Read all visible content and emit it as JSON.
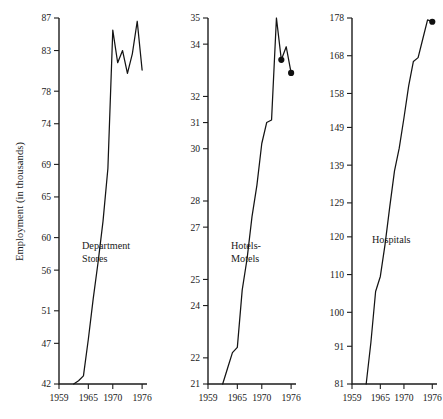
{
  "figure": {
    "background_color": "#ffffff",
    "line_color": "#141414",
    "axis_color": "#1d1d1d",
    "y_axis_title": "Employment (in thousands)"
  },
  "chart_data": [
    {
      "type": "line",
      "title": "Department Stores",
      "series_label": "Department Stores",
      "xlabel": "",
      "ylabel": "Employment (in thousands)",
      "grid": false,
      "legend": "none",
      "xlim": [
        1959,
        1977
      ],
      "ylim": [
        42,
        87
      ],
      "xticks": [
        1959,
        1965,
        1970,
        1976
      ],
      "xticklabels": [
        "1959",
        "1965",
        "1970",
        "1976"
      ],
      "yticks": [
        42,
        47,
        51,
        56,
        60,
        65,
        69,
        74,
        78,
        83,
        87
      ],
      "yticklabels": [
        "42",
        "47",
        "51",
        "56",
        "60",
        "65",
        "69",
        "74",
        "78",
        "83",
        "87"
      ],
      "x": [
        1962,
        1963,
        1964,
        1965,
        1966,
        1967,
        1968,
        1969,
        1970,
        1971,
        1972,
        1973,
        1974,
        1975,
        1976
      ],
      "values": [
        42.0,
        42.4,
        43.0,
        47.5,
        52.5,
        57.0,
        62.0,
        68.5,
        85.5,
        81.5,
        83.0,
        80.2,
        82.6,
        86.6,
        80.6
      ],
      "endpoint_markers": 0
    },
    {
      "type": "line",
      "title": "Hotels-Motels",
      "series_label": "Hotels-Motels",
      "xlabel": "",
      "ylabel": "",
      "grid": false,
      "legend": "none",
      "xlim": [
        1959,
        1977
      ],
      "ylim": [
        21,
        35
      ],
      "xticks": [
        1959,
        1965,
        1970,
        1976
      ],
      "xticklabels": [
        "1959",
        "1965",
        "1970",
        "1976"
      ],
      "yticks": [
        21,
        22,
        24,
        25,
        27,
        28,
        30,
        31,
        32,
        34,
        35
      ],
      "yticklabels": [
        "21",
        "22",
        "24",
        "25",
        "27",
        "28",
        "30",
        "31",
        "32",
        "34",
        "35"
      ],
      "x": [
        1962,
        1963,
        1964,
        1965,
        1966,
        1967,
        1968,
        1969,
        1970,
        1971,
        1972,
        1973,
        1974,
        1975,
        1976
      ],
      "values": [
        21.0,
        21.6,
        22.2,
        22.4,
        24.6,
        25.8,
        27.4,
        28.6,
        30.2,
        31.0,
        31.1,
        35.0,
        33.4,
        33.9,
        32.9
      ],
      "endpoint_markers": 2
    },
    {
      "type": "line",
      "title": "Hospitals",
      "series_label": "Hospitals",
      "xlabel": "",
      "ylabel": "",
      "grid": false,
      "legend": "none",
      "xlim": [
        1959,
        1977
      ],
      "ylim": [
        81,
        178
      ],
      "xticks": [
        1959,
        1965,
        1970,
        1976
      ],
      "xticklabels": [
        "1959",
        "1965",
        "1970",
        "1976"
      ],
      "yticks": [
        81,
        91,
        100,
        110,
        120,
        129,
        139,
        149,
        158,
        168,
        178
      ],
      "yticklabels": [
        "81",
        "91",
        "100",
        "110",
        "120",
        "129",
        "139",
        "149",
        "158",
        "168",
        "178"
      ],
      "x": [
        1962,
        1963,
        1964,
        1965,
        1966,
        1967,
        1968,
        1969,
        1970,
        1971,
        1972,
        1973,
        1974,
        1975,
        1976
      ],
      "values": [
        81.0,
        92.0,
        105.5,
        109.5,
        118.0,
        128.0,
        137.5,
        143.5,
        151.5,
        160.0,
        166.5,
        167.5,
        172.5,
        177.5,
        177.0
      ],
      "endpoint_markers": 1
    }
  ],
  "panels": [
    {
      "name": "department-stores",
      "label": "Department Stores",
      "label_lines": [
        "Department",
        "Stores"
      ]
    },
    {
      "name": "hotels-motels",
      "label": "Hotels-Motels",
      "label_lines": [
        "Hotels-",
        "Motels"
      ]
    },
    {
      "name": "hospitals",
      "label": "Hospitals",
      "label_lines": [
        "Hospitals"
      ]
    }
  ]
}
